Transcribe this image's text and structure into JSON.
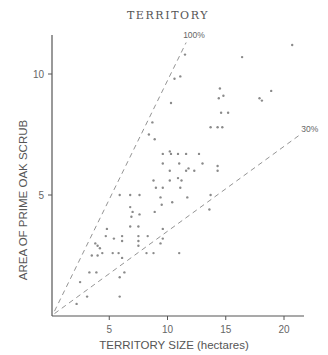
{
  "chart_data": {
    "type": "scatter",
    "title": "TERRITORY",
    "xlabel": "TERRITORY SIZE (hectares)",
    "ylabel": "AREA OF PRIME OAK SCRUB",
    "xlim": [
      0,
      21.5
    ],
    "ylim": [
      0,
      11.8
    ],
    "xticks": [
      5,
      10,
      15,
      20
    ],
    "yticks": [
      5,
      10
    ],
    "grid": false,
    "legend": null,
    "reference_lines": [
      {
        "label": "100%",
        "from": [
          0.3,
          0.2
        ],
        "to": [
          11.6,
          11.3
        ]
      },
      {
        "label": "30%",
        "from": [
          0.3,
          0.1
        ],
        "to": [
          21.4,
          7.5
        ]
      }
    ],
    "points": [
      [
        20.7,
        11.2
      ],
      [
        16.4,
        10.7
      ],
      [
        11.5,
        10.8
      ],
      [
        10.6,
        9.8
      ],
      [
        11.1,
        9.9
      ],
      [
        14.5,
        9.4
      ],
      [
        14.4,
        9.0
      ],
      [
        14.8,
        9.1
      ],
      [
        18.9,
        9.3
      ],
      [
        17.9,
        9.0
      ],
      [
        18.1,
        8.9
      ],
      [
        10.3,
        8.8
      ],
      [
        14.6,
        8.4
      ],
      [
        15.2,
        8.4
      ],
      [
        13.7,
        7.8
      ],
      [
        14.3,
        7.8
      ],
      [
        14.7,
        7.8
      ],
      [
        8.7,
        8.0
      ],
      [
        8.4,
        7.5
      ],
      [
        8.9,
        7.3
      ],
      [
        9.6,
        6.7
      ],
      [
        10.2,
        6.8
      ],
      [
        10.3,
        6.7
      ],
      [
        10.9,
        6.7
      ],
      [
        11.6,
        6.7
      ],
      [
        12.7,
        6.7
      ],
      [
        9.6,
        6.3
      ],
      [
        11.0,
        6.3
      ],
      [
        13.0,
        6.3
      ],
      [
        10.2,
        6.0
      ],
      [
        11.6,
        6.0
      ],
      [
        11.8,
        6.1
      ],
      [
        12.3,
        6.0
      ],
      [
        14.3,
        6.2
      ],
      [
        14.3,
        6.0
      ],
      [
        8.8,
        5.6
      ],
      [
        10.9,
        5.7
      ],
      [
        11.2,
        5.6
      ],
      [
        10.2,
        5.6
      ],
      [
        9.0,
        5.3
      ],
      [
        9.6,
        5.3
      ],
      [
        11.1,
        5.3
      ],
      [
        11.7,
        4.9
      ],
      [
        10.4,
        4.7
      ],
      [
        13.7,
        5.0
      ],
      [
        13.6,
        4.4
      ],
      [
        5.9,
        5.0
      ],
      [
        6.8,
        5.0
      ],
      [
        7.6,
        5.0
      ],
      [
        9.4,
        4.9
      ],
      [
        6.8,
        4.5
      ],
      [
        7.0,
        4.3
      ],
      [
        6.9,
        4.1
      ],
      [
        7.6,
        4.2
      ],
      [
        9.5,
        4.6
      ],
      [
        8.9,
        4.3
      ],
      [
        4.8,
        3.6
      ],
      [
        6.8,
        3.7
      ],
      [
        7.5,
        3.7
      ],
      [
        9.6,
        3.6
      ],
      [
        4.7,
        3.3
      ],
      [
        5.4,
        3.2
      ],
      [
        6.1,
        3.3
      ],
      [
        6.1,
        3.1
      ],
      [
        7.5,
        3.3
      ],
      [
        7.5,
        3.1
      ],
      [
        8.3,
        3.3
      ],
      [
        9.6,
        3.2
      ],
      [
        9.4,
        3.0
      ],
      [
        3.8,
        3.0
      ],
      [
        4.0,
        2.9
      ],
      [
        4.2,
        2.8
      ],
      [
        4.4,
        2.6
      ],
      [
        7.5,
        2.9
      ],
      [
        8.2,
        2.6
      ],
      [
        8.8,
        2.6
      ],
      [
        11.0,
        2.6
      ],
      [
        3.5,
        2.5
      ],
      [
        4.0,
        2.5
      ],
      [
        5.3,
        2.6
      ],
      [
        5.8,
        2.6
      ],
      [
        6.1,
        2.4
      ],
      [
        3.3,
        1.8
      ],
      [
        3.9,
        1.8
      ],
      [
        6.3,
        1.8
      ],
      [
        5.9,
        1.6
      ],
      [
        2.5,
        1.4
      ],
      [
        3.1,
        0.8
      ],
      [
        5.9,
        0.8
      ],
      [
        2.2,
        0.5
      ]
    ]
  }
}
